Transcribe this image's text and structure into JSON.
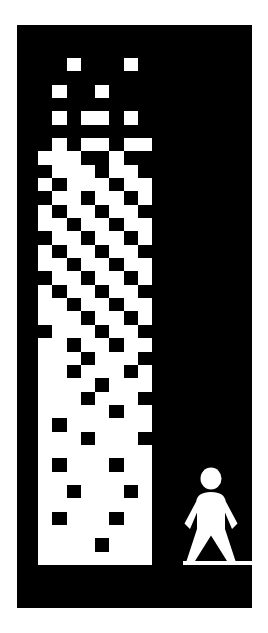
{
  "artwork": {
    "title": "Dithered Gradient Tower with Human Figure",
    "description": "Monochrome pictogram poster: an eight-column dithered halftone tower whose white density increases toward the base, beside a standing human silhouette on a ground line.",
    "background_color": "#ffffff",
    "panel_color": "#000000",
    "ink_color": "#ffffff",
    "panel": {
      "x": 17,
      "y": 25,
      "width": 235,
      "height": 583
    }
  },
  "tower": {
    "label": "dithered-gradient-tower",
    "columns": 8,
    "rows": 38,
    "x": 38,
    "y": 58,
    "width": 114,
    "height": 507,
    "on_color": "#ffffff",
    "off_color": "#000000",
    "notes": "Each row is an 8-character bitmask: 1 = white cell, 0 = black cell. Density of white rises from sparse at the top to solid at the base.",
    "rows_bits": [
      "00100010",
      "00000000",
      "01001000",
      "00000000",
      "01011010",
      "00000000",
      "01011011",
      "11100100",
      "01110110",
      "10111011",
      "01101101",
      "10110110",
      "11011011",
      "01101101",
      "10110110",
      "11011011",
      "01101101",
      "10110110",
      "11011011",
      "11101101",
      "01110110",
      "11011011",
      "11101110",
      "11011101",
      "11110111",
      "11101110",
      "11111011",
      "10111111",
      "11101110",
      "11111111",
      "10111011",
      "11111111",
      "11011101",
      "11111111",
      "10111011",
      "11111111",
      "11110111",
      "11111111"
    ]
  },
  "figure": {
    "label": "standing-human-pictogram",
    "icon": "person-icon",
    "x": 183,
    "y": 465,
    "width": 56,
    "height": 100,
    "color": "#ffffff",
    "parts": [
      "head",
      "torso",
      "left-arm",
      "right-arm",
      "left-leg",
      "right-leg"
    ]
  },
  "ground": {
    "label": "ground-line",
    "x": 183,
    "y": 561,
    "width": 69,
    "height": 4,
    "color": "#ffffff"
  }
}
